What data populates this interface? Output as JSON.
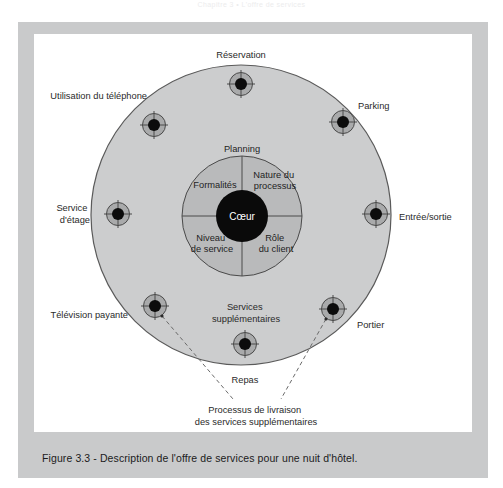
{
  "page": {
    "running_head": "Chapitre 3 • L'offre de services",
    "caption": "Figure 3.3 - Description de l'offre de services pour une nuit d'hôtel."
  },
  "colors": {
    "frame": "#c9cacb",
    "big_circle_fill": "#cccdce",
    "inner_circle_fill": "#b9babb",
    "node_ring_fill": "#a9aaab",
    "core_fill": "#0a0a0a",
    "stroke": "#4a4a4a",
    "text": "#2a2a2a"
  },
  "diagram": {
    "core_label": "Cœur",
    "planning_label": "Planning",
    "quadrants": [
      {
        "key": "formalites",
        "label": "Formalités",
        "lines": [
          "Formalités"
        ]
      },
      {
        "key": "nature-du-processus",
        "label": "Nature du processus",
        "lines": [
          "Nature du",
          "processus"
        ]
      },
      {
        "key": "niveau-de-service",
        "label": "Niveau de service",
        "lines": [
          "Niveau",
          "de service"
        ]
      },
      {
        "key": "role-du-client",
        "label": "Rôle du client",
        "lines": [
          "Rôle",
          "du client"
        ]
      }
    ],
    "peripheral_services": [
      {
        "key": "reservation",
        "label": "Réservation",
        "lines": [
          "Réservation"
        ],
        "node_x": 241,
        "node_y": 84,
        "label_x": 241,
        "label_y": 55,
        "anchor": "middle"
      },
      {
        "key": "utilisation-du-telephone",
        "label": "Utilisation du téléphone",
        "lines": [
          "Utilisation du téléphone"
        ],
        "node_x": 154,
        "node_y": 125,
        "label_x": 140,
        "label_y": 98,
        "anchor": "end"
      },
      {
        "key": "parking",
        "label": "Parking",
        "lines": [
          "Parking"
        ],
        "node_x": 343,
        "node_y": 122,
        "label_x": 358,
        "label_y": 106,
        "anchor": "start"
      },
      {
        "key": "service-d-etage",
        "label": "Service d'étage",
        "lines": [
          "Service",
          "d'étage"
        ],
        "node_x": 118,
        "node_y": 214,
        "label_x": 88,
        "label_y": 207,
        "anchor": "end"
      },
      {
        "key": "entree-sortie",
        "label": "Entrée/sortie",
        "lines": [
          "Entrée/sortie"
        ],
        "node_x": 376,
        "node_y": 214,
        "label_x": 398,
        "label_y": 219,
        "anchor": "start"
      },
      {
        "key": "television-payante",
        "label": "Télévision payante",
        "lines": [
          "Télévision payante"
        ],
        "node_x": 155,
        "node_y": 306,
        "label_x": 128,
        "label_y": 316,
        "anchor": "end"
      },
      {
        "key": "portier",
        "label": "Portier",
        "lines": [
          "Portier"
        ],
        "node_x": 333,
        "node_y": 309,
        "label_x": 357,
        "label_y": 326,
        "anchor": "start"
      },
      {
        "key": "services-supplementaires",
        "label": "Services supplémentaires",
        "lines": [
          "Services",
          "supplémentaires"
        ],
        "node_x": 245,
        "node_y": 344,
        "label_x": 245,
        "label_y": 310,
        "anchor": "middle"
      },
      {
        "key": "repas",
        "label": "Repas",
        "lines": [
          "Repas"
        ],
        "node_x": null,
        "node_y": null,
        "label_x": 245,
        "label_y": 381,
        "anchor": "middle"
      }
    ],
    "annotation": {
      "lines": [
        "Processus de livraison",
        "des services supplémentaires"
      ],
      "x": 256,
      "y": 412
    }
  }
}
